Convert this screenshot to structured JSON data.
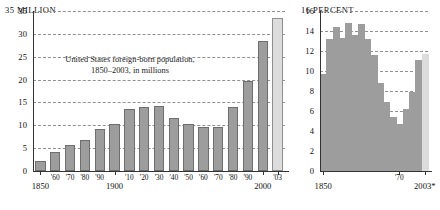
{
  "figure": {
    "background": "#ffffff",
    "bar_color": "#9d9d9d",
    "highlight_color": "#dcdcdc",
    "grid_color": "#8c8c8c"
  },
  "left_panel": {
    "unit_label": "35  MILLION",
    "caption_line1": "United States foreign-born population,",
    "caption_line2": "1850–2003, in millions",
    "y_ticks": [
      "35",
      "30",
      "25",
      "20",
      "15",
      "10",
      "5",
      "0"
    ],
    "x_labels": [
      "1850",
      "'60",
      "'70",
      "'80",
      "'90",
      "1900",
      "'10",
      "'20",
      "'30",
      "'40",
      "'50",
      "'60",
      "'70",
      "'80",
      "'90",
      "2000",
      "'03"
    ]
  },
  "right_panel": {
    "unit_label": "16  PERCENT",
    "caption_line1": "Foreign-born",
    "caption_line2": "population as",
    "caption_line3": "percent of total",
    "y_ticks": [
      "16",
      "14",
      "12",
      "10",
      "8",
      "6",
      "4",
      "2",
      "0"
    ],
    "x_labels": [
      "1850",
      "'70",
      "2003*"
    ]
  },
  "chart_data": [
    {
      "type": "bar",
      "title": "United States foreign-born population, 1850–2003, in millions",
      "xlabel": "",
      "ylabel": "MILLION",
      "ylim": [
        0,
        35
      ],
      "ytick_values": [
        0,
        5,
        10,
        15,
        20,
        25,
        30,
        35
      ],
      "grid": "horizontal-dashed",
      "legend": "none",
      "categories": [
        "1850",
        "1860",
        "1870",
        "1880",
        "1890",
        "1900",
        "1910",
        "1920",
        "1930",
        "1940",
        "1950",
        "1960",
        "1970",
        "1980",
        "1990",
        "2000",
        "2003"
      ],
      "values": [
        2.2,
        4.1,
        5.6,
        6.7,
        9.2,
        10.3,
        13.5,
        13.9,
        14.2,
        11.6,
        10.3,
        9.7,
        9.6,
        14.1,
        19.8,
        28.4,
        33.5
      ],
      "highlight_index": 16,
      "highlight_label": "'03"
    },
    {
      "type": "area",
      "title": "Foreign-born population as percent of total",
      "xlabel": "",
      "ylabel": "PERCENT",
      "ylim": [
        0,
        16
      ],
      "ytick_values": [
        0,
        2,
        4,
        6,
        8,
        10,
        12,
        14,
        16
      ],
      "grid": "horizontal-dashed",
      "legend": "none",
      "x": [
        "1850",
        "1860",
        "1870",
        "1880",
        "1890",
        "1900",
        "1910",
        "1920",
        "1930",
        "1940",
        "1950",
        "1960",
        "1970",
        "1980",
        "1990",
        "2000",
        "2003"
      ],
      "values": [
        9.7,
        13.2,
        14.4,
        13.3,
        14.8,
        13.6,
        14.7,
        13.2,
        11.6,
        8.8,
        6.9,
        5.4,
        4.7,
        6.2,
        7.9,
        11.1,
        11.7
      ],
      "highlight_index": 16,
      "highlight_label": "2003*"
    }
  ]
}
